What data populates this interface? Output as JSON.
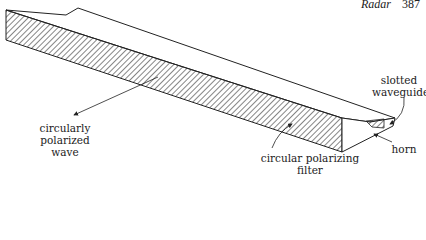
{
  "header": {
    "running_title": "Radar",
    "page_number": "387"
  },
  "diagram": {
    "labels": {
      "slotted_waveguide_line1": "slotted",
      "slotted_waveguide_line2": "waveguide",
      "circularly_polarized_line1": "circularly",
      "circularly_polarized_line2": "polarized wave",
      "polarizing_filter_line1": "circular polarizing",
      "polarizing_filter_line2": "filter",
      "horn": "horn"
    }
  }
}
